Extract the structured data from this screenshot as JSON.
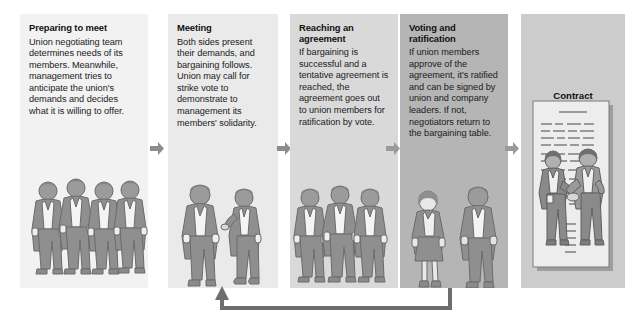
{
  "diagram": {
    "title_visible": false,
    "background": "#ffffff",
    "accent_arrow_color": "#7f7f7f",
    "feedback_arrow_color": "#6e6e6e"
  },
  "panels": [
    {
      "id": "preparing",
      "title": "Preparing to meet",
      "body": "Union negotiating team determines needs of its members. Meanwhile, management tries to anticipate the union's demands and decides what it is willing to offer.",
      "bg": "#f2f2f2",
      "art": "four-union-men",
      "figures": 4
    },
    {
      "id": "meeting",
      "title": "Meeting",
      "body": "Both sides present their demands, and bargaining follows. Union may call for strike vote to demonstrate to management its members' solidarity.",
      "bg": "#eaeaea",
      "art": "two-men-talking",
      "figures": 2
    },
    {
      "id": "agreement",
      "title": "Reaching an agreement",
      "body": "If bargaining is successful and a tentative agreement is reached, the agreement goes out to union members for ratification by vote.",
      "bg": "#d9d9d9",
      "art": "three-men-standing",
      "figures": 3
    },
    {
      "id": "voting",
      "title": "Voting and ratification",
      "body": "If union members approve of the agreement, it's ratified and can be signed by union and company leaders. If not, negotiators return to the bargaining table.",
      "bg": "#b5b5b5",
      "art": "woman-and-man",
      "figures": 2
    },
    {
      "id": "contract",
      "title": "",
      "body": "",
      "bg": "#cccccc",
      "art": "handshake-contract",
      "figures": 2,
      "label": "Contract"
    }
  ],
  "connectors": [
    {
      "id": "arrow-1-2",
      "from": "preparing",
      "to": "meeting",
      "icon": "arrow-right-icon"
    },
    {
      "id": "arrow-2-3",
      "from": "meeting",
      "to": "agreement",
      "icon": "arrow-right-icon"
    },
    {
      "id": "arrow-3-4",
      "from": "agreement",
      "to": "voting",
      "icon": "arrow-right-icon"
    },
    {
      "id": "arrow-4-5",
      "from": "voting",
      "to": "contract",
      "icon": "arrow-right-icon"
    },
    {
      "id": "feedback-arrow",
      "from": "voting",
      "to": "meeting",
      "icon": "arrow-up-icon",
      "style": "elbow-return"
    }
  ],
  "palette": {
    "suit": "#8f8f8f",
    "suit_dark": "#7a7a7a",
    "skin": "#b4b4b4",
    "shirt": "#f4f4f4",
    "outline": "#6b6b6b",
    "paper": "#ededed"
  }
}
